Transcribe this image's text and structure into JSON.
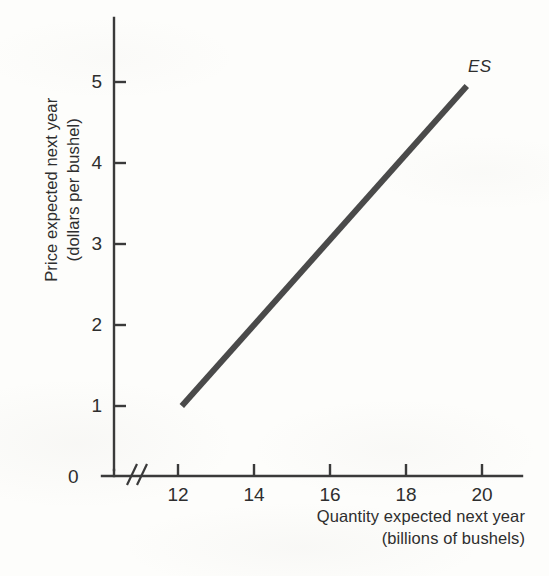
{
  "chart_data": {
    "type": "line",
    "title": "",
    "xlabel": "Quantity expected next year\n(billions of bushels)",
    "xlabel_line1": "Quantity expected next year",
    "xlabel_line2": "(billions of bushels)",
    "ylabel": "Price expected next year\n(dollars per bushel)",
    "ylabel_line1": "Price expected next year",
    "ylabel_line2": "(dollars per bushel)",
    "xlim": [
      11.2,
      21.1
    ],
    "ylim": [
      0,
      5.7
    ],
    "xticks": [
      12,
      14,
      16,
      18,
      20
    ],
    "xtick_labels": [
      "12",
      "14",
      "16",
      "18",
      "20"
    ],
    "yticks": [
      1,
      2,
      3,
      4,
      5
    ],
    "ytick_labels": [
      "1",
      "2",
      "3",
      "4",
      "5"
    ],
    "origin_label": "0",
    "axis_break": "//",
    "grid": false,
    "legend_position": "inline-right",
    "series": [
      {
        "name": "ES",
        "label": "ES",
        "color": "#4a4a4a",
        "line_width": 6,
        "x": [
          12.1,
          19.6
        ],
        "y": [
          1.0,
          4.95
        ],
        "points": [
          {
            "x": 12.1,
            "y": 1.0
          },
          {
            "x": 19.6,
            "y": 4.95
          }
        ]
      }
    ],
    "annotations": [
      {
        "text": "ES",
        "x": 19.9,
        "y": 5.25,
        "style": "italic"
      }
    ]
  },
  "style": {
    "background": "#fdfdfb",
    "axis_color": "#3a3a3a",
    "text_color": "#2e2e2e",
    "curve_color": "#4a4a4a"
  }
}
